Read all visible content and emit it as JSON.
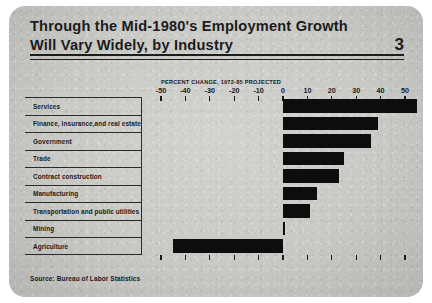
{
  "card": {
    "title_line1": "Through the Mid-1980's Employment Growth",
    "title_line2": "Will Vary Widely, by Industry",
    "page_number": "3",
    "source": "Source:  Bureau of Labor Statistics",
    "background_color": "#c9c9c6",
    "bar_color": "#0d0d0d",
    "text_color": "#1b1b1b"
  },
  "chart_data": {
    "type": "bar",
    "orientation": "horizontal",
    "title": "Through the Mid-1980's Employment Growth Will Vary Widely, by Industry",
    "xlabel": "PERCENT CHANGE, 1972-85 PROJECTED",
    "ylabel": "",
    "xlim": [
      -55,
      56
    ],
    "xticks": [
      -50,
      -40,
      -30,
      -20,
      -10,
      0,
      10,
      20,
      30,
      40,
      50
    ],
    "xtick_labels": [
      "-50",
      "-40",
      "-30",
      "-20",
      "-10",
      "0",
      "10",
      "20",
      "30",
      "40",
      "50"
    ],
    "grid": false,
    "legend": "none",
    "source": "Bureau of Labor Statistics",
    "categories": [
      "Services",
      "Finance, insurance,and real estate",
      "Government",
      "Trade",
      "Contract construction",
      "Manufacturing",
      "Transportation and public utilities",
      "Mining",
      "Agriculture"
    ],
    "values": [
      55,
      39,
      36,
      25,
      23,
      14,
      11,
      1,
      -45
    ]
  }
}
